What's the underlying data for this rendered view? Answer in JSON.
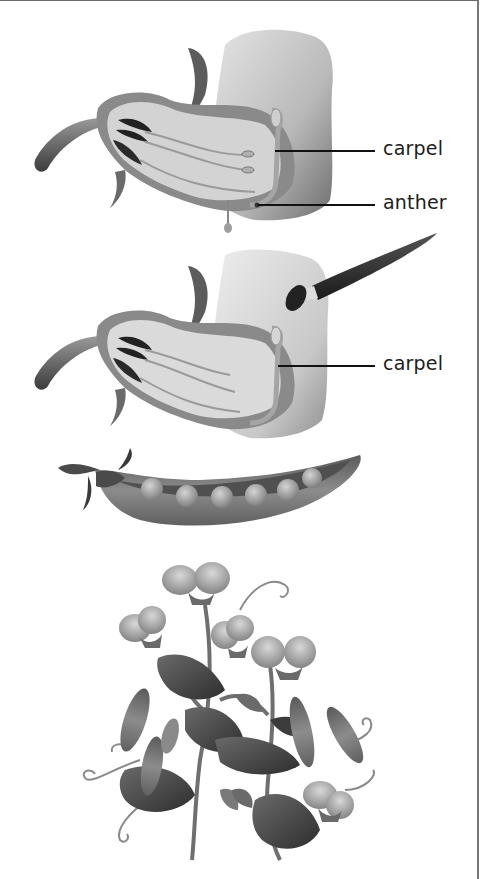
{
  "diagram": {
    "panels": [
      {
        "id": "flower-cutaway-1",
        "description": "Cross-section of pea flower showing carpel and anthers",
        "labels": [
          {
            "text": "carpel",
            "target": "carpel"
          },
          {
            "text": "anther",
            "target": "anther"
          }
        ]
      },
      {
        "id": "flower-cutaway-2",
        "description": "Cross-section of pea flower with anthers removed; paintbrush transferring pollen onto carpel",
        "labels": [
          {
            "text": "carpel",
            "target": "carpel"
          }
        ]
      },
      {
        "id": "pea-pod",
        "description": "Open pea pod with six peas"
      },
      {
        "id": "pea-plant",
        "description": "Pea plant with flowers, pods, leaves and tendrils"
      }
    ]
  },
  "colors": {
    "label_text": "#1c1c1c",
    "leader_line": "#111111",
    "frame": "#777777"
  }
}
